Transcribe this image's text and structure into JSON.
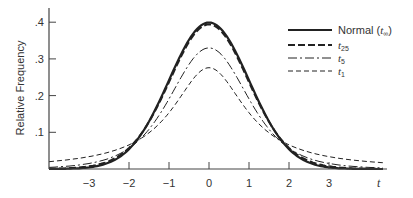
{
  "chart_data": {
    "type": "line",
    "title": "",
    "xlabel": "t",
    "ylabel": "Relative Frequency",
    "xlim": [
      -4.0,
      4.4
    ],
    "ylim": [
      0,
      0.44
    ],
    "x_ticks": [
      "-3",
      "-2",
      "-1",
      "0",
      "1",
      "2",
      "3"
    ],
    "x_tick_values": [
      -3,
      -2,
      -1,
      0,
      1,
      2,
      3
    ],
    "y_ticks": [
      ".1",
      ".2",
      ".3",
      ".4"
    ],
    "y_tick_values": [
      0.1,
      0.2,
      0.3,
      0.4
    ],
    "grid": false,
    "legend_position": "upper right",
    "series": [
      {
        "name": "Normal (t∞)",
        "label_main": "Normal (",
        "label_sub": "∞",
        "label_var": "t",
        "label_close": ")",
        "df": "inf",
        "peak": 0.399,
        "style": "solid",
        "width": 2.2
      },
      {
        "name": "t25",
        "label_var": "t",
        "label_sub": "25",
        "df": 25,
        "peak": 0.394,
        "style": "dashed-long",
        "width": 2.0
      },
      {
        "name": "t5",
        "label_var": "t",
        "label_sub": "5",
        "df": 5,
        "peak": 0.33,
        "style": "dash-dot",
        "width": 1.0
      },
      {
        "name": "t1",
        "label_var": "t",
        "label_sub": "1",
        "df": 1,
        "peak": 0.3,
        "style": "dashed",
        "width": 1.0
      }
    ],
    "sample_points": {
      "x": [
        -4,
        -3,
        -2,
        -1,
        0,
        1,
        2,
        3,
        4
      ],
      "Normal": [
        0.0001,
        0.004,
        0.054,
        0.242,
        0.399,
        0.242,
        0.054,
        0.004,
        0.0001
      ],
      "t25": [
        0.001,
        0.007,
        0.056,
        0.238,
        0.394,
        0.238,
        0.056,
        0.007,
        0.001
      ],
      "t5": [
        0.009,
        0.024,
        0.065,
        0.2,
        0.33,
        0.2,
        0.065,
        0.024,
        0.009
      ],
      "t1": [
        0.03,
        0.05,
        0.08,
        0.19,
        0.3,
        0.19,
        0.08,
        0.05,
        0.03
      ]
    }
  },
  "axes": {
    "ylabel": "Relative Frequency",
    "xlabel": "t"
  }
}
